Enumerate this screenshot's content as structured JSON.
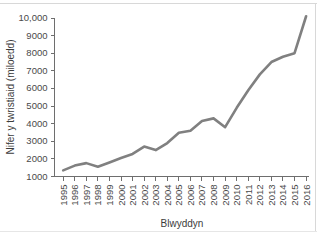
{
  "chart_data": {
    "type": "line",
    "title": "",
    "xlabel": "Blwyddyn",
    "ylabel": "Nifer y twristiaid (miloedd)",
    "categories": [
      "1995",
      "1996",
      "1997",
      "1998",
      "1999",
      "2000",
      "2001",
      "2002",
      "2003",
      "2004",
      "2005",
      "2006",
      "2007",
      "2008",
      "2009",
      "2010",
      "2011",
      "2012",
      "2013",
      "2014",
      "2015",
      "2016"
    ],
    "x": [
      1995,
      1996,
      1997,
      1998,
      1999,
      2000,
      2001,
      2002,
      2003,
      2004,
      2005,
      2006,
      2007,
      2008,
      2009,
      2010,
      2011,
      2012,
      2013,
      2014,
      2015,
      2016
    ],
    "values": [
      1350,
      1620,
      1760,
      1550,
      1800,
      2050,
      2280,
      2700,
      2500,
      2900,
      3480,
      3600,
      4150,
      4300,
      3800,
      4900,
      5900,
      6800,
      7500,
      7800,
      8000,
      10100
    ],
    "series": [
      {
        "name": "Nifer y twristiaid",
        "color": "#808080",
        "values": [
          1350,
          1620,
          1760,
          1550,
          1800,
          2050,
          2280,
          2700,
          2500,
          2900,
          3480,
          3600,
          4150,
          4300,
          3800,
          4900,
          5900,
          6800,
          7500,
          7800,
          8000,
          10100
        ]
      }
    ],
    "ylim": [
      1000,
      10000
    ],
    "ytick_labels": [
      "1000",
      "2000",
      "3000",
      "4000",
      "5000",
      "6000",
      "7000",
      "8000",
      "9000",
      "10,000"
    ],
    "ytick_values": [
      1000,
      2000,
      3000,
      4000,
      5000,
      6000,
      7000,
      8000,
      9000,
      10000
    ],
    "grid": false,
    "legend": false,
    "legend_position": "none",
    "line_color": "#808080",
    "axis_color": "#6e6e6e",
    "background": "#ffffff"
  }
}
